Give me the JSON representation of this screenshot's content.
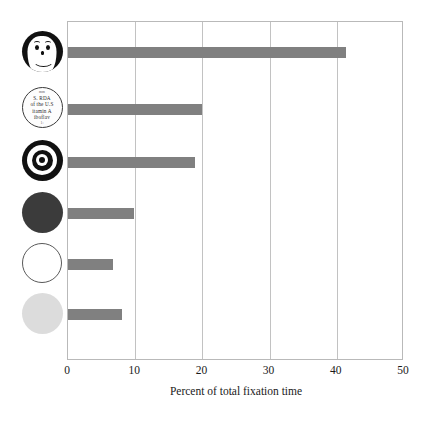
{
  "chart_data": {
    "type": "bar",
    "orientation": "horizontal",
    "title": "",
    "subtitle": "",
    "xlabel": "Percent of total fixation time",
    "ylabel": "",
    "xlim": [
      0,
      50
    ],
    "xticks": [
      0,
      10,
      20,
      30,
      40,
      50
    ],
    "xtick_labels": [
      "0",
      "10",
      "20",
      "30",
      "40",
      "50"
    ],
    "grid": "vertical",
    "legend": "none",
    "bar_color": "#808080",
    "frame_color": "#b9b9b9",
    "gridline_color": "#c2c2c2",
    "categories": [
      "smiley-face",
      "newsprint-text-disc",
      "bullseye-target",
      "solid-dark-disc",
      "white-outline-disc",
      "light-gray-disc"
    ],
    "category_icons": [
      "smiley-face-icon",
      "newsprint-disc-icon",
      "bullseye-icon",
      "dark-disc-icon",
      "white-disc-icon",
      "light-gray-disc-icon"
    ],
    "values": [
      41.3,
      19.9,
      18.9,
      9.8,
      6.7,
      8.1
    ]
  },
  "newsprint_icon": {
    "lines": [
      "mm",
      "S.  RDA",
      "of the U.S",
      "itamin  A",
      "iboflav",
      "1:"
    ]
  }
}
